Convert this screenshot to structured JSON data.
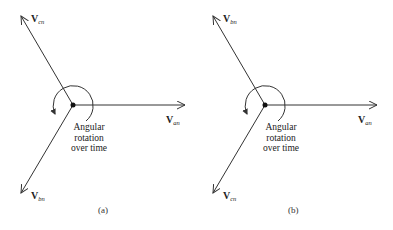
{
  "panels": [
    {
      "caption": "(a)",
      "note_lines": [
        "Angular",
        "rotation",
        "over time"
      ],
      "phasors": {
        "right": {
          "symbol": "V",
          "subscript": "an"
        },
        "upper_left": {
          "symbol": "V",
          "subscript": "cn"
        },
        "lower_left": {
          "symbol": "V",
          "subscript": "bn"
        }
      }
    },
    {
      "caption": "(b)",
      "note_lines": [
        "Angular",
        "rotation",
        "over time"
      ],
      "phasors": {
        "right": {
          "symbol": "V",
          "subscript": "an"
        },
        "upper_left": {
          "symbol": "V",
          "subscript": "bn"
        },
        "lower_left": {
          "symbol": "V",
          "subscript": "cn"
        }
      }
    }
  ],
  "colors": {
    "line": "#333333",
    "background": "#ffffff"
  }
}
